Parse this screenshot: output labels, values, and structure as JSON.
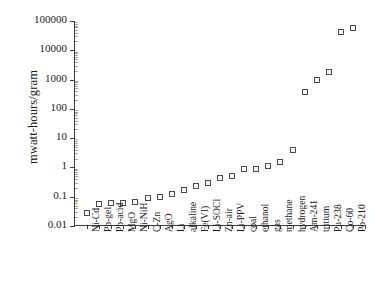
{
  "chart_data": {
    "type": "scatter",
    "title": "",
    "xlabel": "",
    "ylabel": "mwatt-hours/gram",
    "yscale": "log",
    "ylim": [
      0.01,
      100000
    ],
    "yticks": [
      0.01,
      0.1,
      1,
      10,
      100,
      1000,
      10000,
      100000
    ],
    "ytick_labels": [
      "0.01",
      "0.1",
      "1",
      "10",
      "100",
      "1000",
      "10000",
      "100000"
    ],
    "grid": false,
    "legend": "none",
    "marker": "open-square",
    "categories": [
      "Ni-Cd",
      "Pb-gel",
      "Pb-acid",
      "MgO",
      "Ni-NiH",
      "C-Zn",
      "AgO",
      "Li",
      "alkaline",
      "Fe(VI)",
      "Li-SOCl",
      "Zn-air",
      "Li-PPV",
      "coal",
      "ethanol",
      "gas",
      "methane",
      "hydrogen",
      "Am-241",
      "tritium",
      "Pu-238",
      "Co-60",
      "Po-210"
    ],
    "values": [
      0.028,
      0.055,
      0.063,
      0.063,
      0.066,
      0.088,
      0.1,
      0.12,
      0.165,
      0.235,
      0.285,
      0.43,
      0.52,
      0.86,
      0.87,
      1.12,
      1.5,
      3.9,
      370,
      950,
      1800,
      42000,
      57000
    ]
  }
}
